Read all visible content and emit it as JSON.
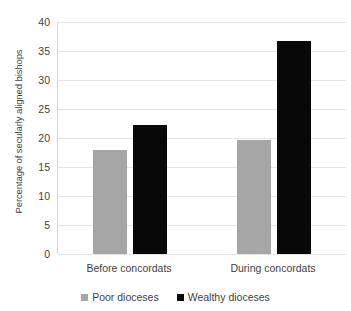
{
  "chart_data": {
    "type": "bar",
    "title": "",
    "subtitle": "",
    "xlabel": "",
    "ylabel": "Percentage of secularly aligned bishops",
    "categories": [
      "Before concordats",
      "During concordats"
    ],
    "series": [
      {
        "name": "Poor dioceses",
        "color": "#a6a6a6",
        "values": [
          18.0,
          19.7
        ]
      },
      {
        "name": "Wealthy dioceses",
        "color": "#080808",
        "values": [
          22.3,
          36.7
        ]
      }
    ],
    "ylim": [
      0,
      40
    ],
    "ytick_values": [
      40,
      35,
      30,
      25,
      20,
      15,
      10,
      5,
      0
    ],
    "ytick_labels": [
      "40",
      "35",
      "30",
      "25",
      "20",
      "15",
      "10",
      "5",
      "0"
    ],
    "grid": true,
    "grid_axis": "y",
    "legend_position": "bottom",
    "background_color": "#ffffff",
    "text_color": "#3f3f3f",
    "gridline_color": "#e4e4e4"
  }
}
